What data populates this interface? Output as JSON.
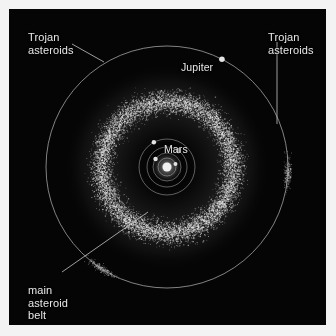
{
  "figure": {
    "kind": "astronomical-diagram",
    "background_color": "#050505",
    "page_color": "#f3f3f3",
    "label_color": "#e8e8e8",
    "orbit_color": "#9a9a9a",
    "belt_color": "#d8d8d8"
  },
  "labels": {
    "trojan_left": "Trojan\nasteroids",
    "trojan_right": "Trojan\nasteroids",
    "main_belt": "main\nasteroid\nbelt",
    "jupiter": "Jupiter",
    "mars": "Mars"
  },
  "chart_data": {
    "type": "scatter",
    "title": "",
    "xlabel": "",
    "ylabel": "",
    "view": {
      "center_x": 158,
      "center_y": 158,
      "grid": false,
      "legend": false
    },
    "orbits": [
      {
        "name": "Mercury",
        "radius": 9,
        "planet_angle_deg": 20,
        "planet_size": 2.0,
        "label": ""
      },
      {
        "name": "Venus",
        "radius": 14,
        "planet_angle_deg": 145,
        "planet_size": 2.2,
        "label": ""
      },
      {
        "name": "Earth",
        "radius": 20,
        "planet_angle_deg": 55,
        "planet_size": 2.6,
        "label": ""
      },
      {
        "name": "Mars",
        "radius": 28,
        "planet_angle_deg": 118,
        "planet_size": 2.2,
        "label": "Mars"
      },
      {
        "name": "Jupiter",
        "radius": 121,
        "planet_angle_deg": 63,
        "planet_size": 2.8,
        "label": "Jupiter"
      }
    ],
    "sun": {
      "radius": 4.5,
      "color": "#f0f0f0"
    },
    "belt": {
      "name": "main asteroid belt",
      "inner_radius": 42,
      "outer_radius": 96,
      "peak_radius": 66,
      "point_count": 9000,
      "point_color": "#e6e6e6"
    },
    "trojan_clouds": [
      {
        "name": "L4",
        "orbit_radius": 121,
        "angle_deg": 123,
        "point_count": 260
      },
      {
        "name": "L5",
        "orbit_radius": 121,
        "angle_deg": 3,
        "point_count": 260
      }
    ],
    "leader_lines": [
      {
        "from_label": "trojan_left",
        "x1": 72,
        "y1": 44,
        "x2": 104,
        "y2": 62
      },
      {
        "from_label": "trojan_right",
        "x1": 277,
        "y1": 42,
        "x2": 277,
        "y2": 124
      },
      {
        "from_label": "main_belt",
        "x1": 62,
        "y1": 272,
        "x2": 148,
        "y2": 212
      }
    ]
  }
}
